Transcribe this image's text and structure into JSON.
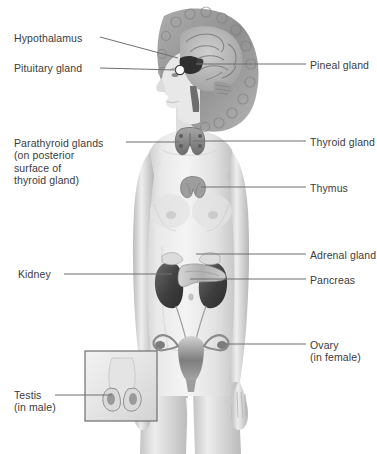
{
  "figure": {
    "background_color": "#ffffff",
    "text_color": "#3b3b3b",
    "leader_line_color": "#6f6f6f",
    "inset_border_color": "#6f6f6f"
  },
  "labels_left": [
    {
      "id": "hypothalamus",
      "text": "Hypothalamus",
      "sublines": [],
      "text_x": 14,
      "text_y": 32,
      "leader": {
        "x1": 100,
        "y1": 37,
        "x2": 178,
        "y2": 58
      }
    },
    {
      "id": "pituitary-gland",
      "text": "Pituitary gland",
      "sublines": [],
      "text_x": 14,
      "text_y": 62,
      "leader": {
        "x1": 100,
        "y1": 68,
        "x2": 176,
        "y2": 70
      }
    },
    {
      "id": "parathyroid-glands",
      "text": "Parathyroid glands",
      "sublines": [
        "(on posterior",
        "surface of",
        "thyroid gland)"
      ],
      "text_x": 14,
      "text_y": 137,
      "leader": {
        "x1": 126,
        "y1": 142,
        "x2": 180,
        "y2": 142
      }
    },
    {
      "id": "kidney",
      "text": "Kidney",
      "sublines": [],
      "text_x": 18,
      "text_y": 268,
      "leader": {
        "x1": 64,
        "y1": 274,
        "x2": 172,
        "y2": 274
      }
    },
    {
      "id": "testis",
      "text": "Testis",
      "sublines": [
        "(in male)"
      ],
      "text_x": 14,
      "text_y": 389,
      "leader": {
        "x1": 55,
        "y1": 395,
        "x2": 112,
        "y2": 395
      }
    }
  ],
  "labels_right": [
    {
      "id": "pineal-gland",
      "text": "Pineal gland",
      "sublines": [],
      "text_x": 310,
      "text_y": 59,
      "leader": {
        "x1": 196,
        "y1": 64,
        "x2": 306,
        "y2": 64
      }
    },
    {
      "id": "thyroid-gland",
      "text": "Thyroid gland",
      "sublines": [],
      "text_x": 310,
      "text_y": 136,
      "leader": {
        "x1": 193,
        "y1": 141,
        "x2": 306,
        "y2": 141
      }
    },
    {
      "id": "thymus",
      "text": "Thymus",
      "sublines": [],
      "text_x": 310,
      "text_y": 182,
      "leader": {
        "x1": 201,
        "y1": 187,
        "x2": 306,
        "y2": 187
      }
    },
    {
      "id": "adrenal-gland",
      "text": "Adrenal gland",
      "sublines": [],
      "text_x": 310,
      "text_y": 249,
      "leader": {
        "x1": 196,
        "y1": 254,
        "x2": 306,
        "y2": 254
      }
    },
    {
      "id": "pancreas",
      "text": "Pancreas",
      "sublines": [],
      "text_x": 310,
      "text_y": 274,
      "leader": {
        "x1": 190,
        "y1": 279,
        "x2": 306,
        "y2": 279
      }
    },
    {
      "id": "ovary",
      "text": "Ovary",
      "sublines": [
        "(in female)"
      ],
      "text_x": 310,
      "text_y": 339,
      "leader": {
        "x1": 226,
        "y1": 344,
        "x2": 306,
        "y2": 344
      }
    }
  ],
  "organs": [
    {
      "id": "brain",
      "name": "brain (sagittal section)",
      "color": "#9a9a9a"
    },
    {
      "id": "hypothalamus-organ",
      "name": "hypothalamus",
      "color": "#3a3a3a"
    },
    {
      "id": "pituitary-organ",
      "name": "pituitary gland",
      "color": "#ffffff"
    },
    {
      "id": "pineal-organ",
      "name": "pineal gland",
      "color": "#454545"
    },
    {
      "id": "thyroid-organ",
      "name": "thyroid gland",
      "color": "#8a8a8a"
    },
    {
      "id": "parathyroid-organ",
      "name": "parathyroid glands",
      "color": "#6a6a6a"
    },
    {
      "id": "thymus-organ",
      "name": "thymus",
      "color": "#9a9a9a"
    },
    {
      "id": "adrenal-organ",
      "name": "adrenal glands",
      "color": "#d8d8d8"
    },
    {
      "id": "pancreas-organ",
      "name": "pancreas",
      "color": "#b8b8b8"
    },
    {
      "id": "kidney-organ",
      "name": "kidneys",
      "color": "#4a4a4a"
    },
    {
      "id": "uterus-organ",
      "name": "uterus",
      "color": "#8d8d8d"
    },
    {
      "id": "ovary-organ",
      "name": "ovaries",
      "color": "#7a7a7a"
    },
    {
      "id": "testis-organ",
      "name": "testes",
      "color": "#8a8a8a"
    }
  ],
  "inset": {
    "id": "testis-inset",
    "name": "male testis inset panel",
    "x": 85,
    "y": 351,
    "width": 72,
    "height": 70
  }
}
